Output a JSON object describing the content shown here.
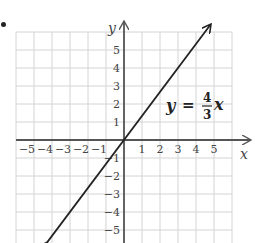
{
  "chart_data": {
    "type": "line",
    "title": "",
    "equation": {
      "lhs": "y",
      "eq": "=",
      "numerator": "4",
      "denominator": "3",
      "var": "x"
    },
    "xlabel": "x",
    "ylabel": "y",
    "xlim": [
      -6,
      6
    ],
    "ylim": [
      -6,
      6
    ],
    "grid": true,
    "x_ticks": [
      "−5",
      "−4",
      "−3",
      "−2",
      "−1",
      "1",
      "2",
      "3",
      "4",
      "5"
    ],
    "y_ticks": [
      "5",
      "4",
      "3",
      "2",
      "1",
      "−1",
      "−2",
      "−3",
      "−4",
      "−5"
    ],
    "series": [
      {
        "name": "y = 4/3 x",
        "slope": 1.3333,
        "intercept": 0,
        "x": [
          -4.3,
          0,
          4.8
        ],
        "y": [
          -5.73,
          0,
          6.4
        ],
        "arrows": "both"
      }
    ],
    "colors": {
      "grid": "#d4d4d4",
      "axis": "#555555",
      "line": "#222222"
    }
  }
}
